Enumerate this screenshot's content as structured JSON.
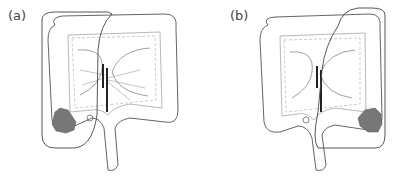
{
  "figure": {
    "panels": [
      {
        "id": "a",
        "label": "(a)",
        "description": "Colon diagram with tumor in cecum/ascending colon; resection margin encloses right colon",
        "tumor_location": "cecum"
      },
      {
        "id": "b",
        "label": "(b)",
        "description": "Colon diagram with tumor in descending/sigmoid junction; resection margin encloses left colon",
        "tumor_location": "sigmoid-descending"
      }
    ],
    "colors": {
      "outline": "#555555",
      "tumor": "#777777",
      "vessel_clamp": "#222222",
      "background": "#ffffff"
    }
  }
}
